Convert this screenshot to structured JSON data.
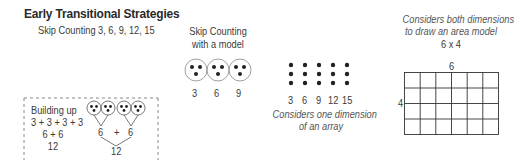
{
  "title": "Early Transitional Strategies",
  "skip_counting": {
    "label": "Skip Counting 3, 6, 9, 12, 15"
  },
  "skip_counting_model": {
    "label_line1": "Skip Counting",
    "label_line2": "with a model",
    "groups": [
      {
        "dots": 3,
        "value": "3"
      },
      {
        "dots": 3,
        "value": "6"
      },
      {
        "dots": 3,
        "value": "9"
      }
    ]
  },
  "building_up": {
    "label": "Building up",
    "steps": [
      "3 + 3 + 3 + 3",
      "6 + 6",
      "12"
    ],
    "diagram": {
      "groups_count": 4,
      "partial_left": "6",
      "operator": "+",
      "partial_right": "6",
      "total": "12"
    }
  },
  "array": {
    "columns": 5,
    "rows": 3,
    "values": [
      "3",
      "6",
      "9",
      "12",
      "15"
    ],
    "caption_line1": "Considers one dimension",
    "caption_line2": "of an array"
  },
  "area_model": {
    "caption_line1": "Considers both dimensions",
    "caption_line2": "to draw an area model",
    "expression": "6 x 4",
    "top_label": "6",
    "side_label": "4",
    "columns": 6,
    "rows": 4
  },
  "colors": {
    "text": "#333333",
    "lines": "#444444",
    "circle_stroke": "#777777",
    "dashed_border": "#888888"
  }
}
